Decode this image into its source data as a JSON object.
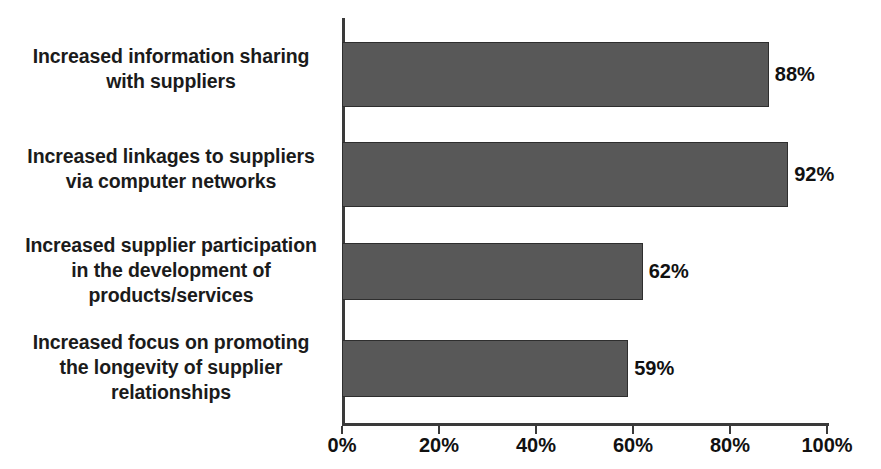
{
  "chart_data": {
    "type": "bar",
    "orientation": "horizontal",
    "title": "",
    "subtitle": "",
    "xlabel": "",
    "ylabel": "",
    "xlim": [
      0,
      100
    ],
    "grid": false,
    "legend": null,
    "tick_suffix": "%",
    "categories": [
      "Increased information sharing\nwith suppliers",
      "Increased linkages to suppliers\nvia computer networks",
      "Increased supplier participation\nin the development of\nproducts/services",
      "Increased focus on promoting\nthe longevity of supplier\nrelationships"
    ],
    "values": [
      88,
      92,
      62,
      59
    ],
    "value_labels": [
      "88%",
      "92%",
      "62%",
      "59%"
    ],
    "xticks": [
      0,
      20,
      40,
      60,
      80,
      100
    ],
    "xtick_labels": [
      "0%",
      "20%",
      "40%",
      "60%",
      "80%",
      "100%"
    ],
    "colors": {
      "bar_fill": "#585858",
      "bar_border": "#2e2e2e",
      "axis": "#3a3a3a",
      "text": "#111111",
      "label_text": "#1b1b1b",
      "background": "#ffffff"
    }
  },
  "bars": [
    {
      "label": "Increased information sharing\nwith suppliers",
      "value_label": "88%",
      "top": 42,
      "height": 65
    },
    {
      "label": "Increased linkages to suppliers\nvia computer networks",
      "value_label": "92%",
      "top": 142,
      "height": 65
    },
    {
      "label": "Increased supplier participation\nin the development of\nproducts/services",
      "value_label": "62%",
      "top": 243,
      "height": 57
    },
    {
      "label": "Increased focus on promoting\nthe longevity of supplier\nrelationships",
      "value_label": "59%",
      "top": 340,
      "height": 57
    }
  ]
}
